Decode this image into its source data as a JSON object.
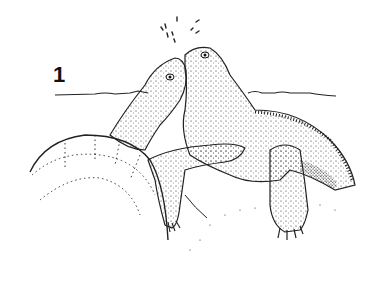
{
  "figure": {
    "label": "1",
    "colors": {
      "ink": "#1a1a1a",
      "background": "#ffffff"
    }
  }
}
